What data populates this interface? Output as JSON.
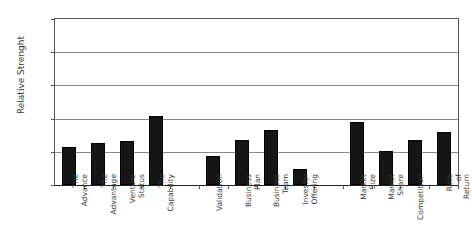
{
  "chart_data": {
    "type": "bar",
    "title": "",
    "xlabel": "",
    "ylabel": "Relative Strenght",
    "ylim": [
      0,
      100
    ],
    "grid": true,
    "legend": null,
    "y_ticks": [
      "0",
      "20%",
      "40%",
      "60%",
      "80%",
      "100%"
    ],
    "y_tick_values": [
      0,
      20,
      40,
      60,
      80,
      100
    ],
    "categories": [
      "The Advance",
      "The Advantage",
      "Venture Status",
      "The Capability",
      "Validation",
      "Business Plan",
      "Business Team",
      "Investor Offering",
      "Market Size",
      "Market Share",
      "Competition",
      "Rate of Return"
    ],
    "values": [
      22.8,
      25.3,
      26.8,
      41.6,
      17.4,
      27.2,
      33.2,
      9.6,
      38.2,
      20.5,
      27.4,
      32.1
    ],
    "bar_color": "#151515",
    "slots": [
      {
        "category": "The Advance",
        "value": 22.8
      },
      {
        "category": "The Advantage",
        "value": 25.3
      },
      {
        "category": "Venture Status",
        "value": 26.8
      },
      {
        "category": "The Capability",
        "value": 41.6
      },
      {
        "category": "",
        "value": null
      },
      {
        "category": "Validation",
        "value": 17.4
      },
      {
        "category": "Business Plan",
        "value": 27.2
      },
      {
        "category": "Business Team",
        "value": 33.2
      },
      {
        "category": "Investor Offering",
        "value": 9.6
      },
      {
        "category": "",
        "value": null
      },
      {
        "category": "Market Size",
        "value": 38.2
      },
      {
        "category": "Market Share",
        "value": 20.5
      },
      {
        "category": "Competition",
        "value": 27.4
      },
      {
        "category": "Rate of Return",
        "value": 32.1
      }
    ]
  },
  "axes": {
    "y_title": "Relative Strenght"
  }
}
